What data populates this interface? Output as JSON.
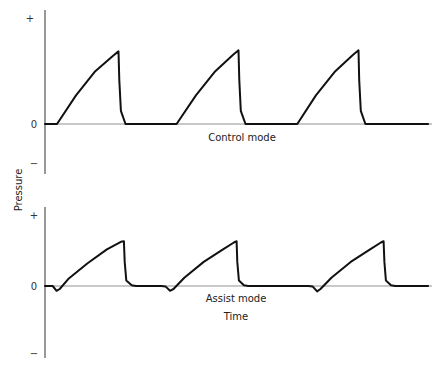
{
  "chart_data": [
    {
      "type": "line",
      "title": "Control mode",
      "xlabel": "",
      "ylabel": "Pressure",
      "ytick_labels": [
        "+",
        "0",
        "−"
      ],
      "grid": false,
      "x_units": "time (relative, 0-100)",
      "y_units": "pressure (relative, -1 to 1)",
      "ylim": [
        -1,
        1
      ],
      "xlim": [
        0,
        100
      ],
      "series": [
        {
          "name": "Control mode pressure",
          "points": [
            [
              0,
              0
            ],
            [
              3.1,
              0
            ],
            [
              8,
              0.26
            ],
            [
              13,
              0.48
            ],
            [
              17.6,
              0.62
            ],
            [
              19,
              0.66
            ],
            [
              19.2,
              0.4
            ],
            [
              19.6,
              0.12
            ],
            [
              20.8,
              0
            ],
            [
              34,
              0
            ],
            [
              39,
              0.26
            ],
            [
              44,
              0.48
            ],
            [
              48.6,
              0.63
            ],
            [
              50,
              0.67
            ],
            [
              50.2,
              0.4
            ],
            [
              50.6,
              0.12
            ],
            [
              51.8,
              0
            ],
            [
              65.2,
              0
            ],
            [
              70,
              0.26
            ],
            [
              75,
              0.48
            ],
            [
              79.6,
              0.63
            ],
            [
              81,
              0.67
            ],
            [
              81.2,
              0.4
            ],
            [
              81.6,
              0.12
            ],
            [
              82.8,
              0
            ],
            [
              99,
              0
            ]
          ]
        }
      ]
    },
    {
      "type": "line",
      "title": "Assist mode",
      "xlabel": "Time",
      "ylabel": "Pressure",
      "ytick_labels": [
        "+",
        "0",
        "−"
      ],
      "grid": false,
      "x_units": "time (relative, 0-100)",
      "y_units": "pressure (relative, -1 to 1)",
      "ylim": [
        -1,
        1
      ],
      "xlim": [
        0,
        100
      ],
      "series": [
        {
          "name": "Assist mode pressure",
          "points": [
            [
              0,
              0
            ],
            [
              2,
              0
            ],
            [
              3,
              -0.08
            ],
            [
              3.8,
              -0.05
            ],
            [
              6,
              0.1
            ],
            [
              11,
              0.33
            ],
            [
              16,
              0.53
            ],
            [
              19.6,
              0.64
            ],
            [
              20.4,
              0.65
            ],
            [
              20.6,
              0.35
            ],
            [
              21,
              0.08
            ],
            [
              22.4,
              0.01
            ],
            [
              23.5,
              0
            ],
            [
              30,
              0
            ],
            [
              31.2,
              -0.01
            ],
            [
              32.3,
              -0.08
            ],
            [
              33.2,
              -0.05
            ],
            [
              36,
              0.12
            ],
            [
              41,
              0.35
            ],
            [
              46,
              0.53
            ],
            [
              48.8,
              0.63
            ],
            [
              49.5,
              0.65
            ],
            [
              49.7,
              0.35
            ],
            [
              50.1,
              0.08
            ],
            [
              51.4,
              0.01
            ],
            [
              52.5,
              0
            ],
            [
              68,
              0
            ],
            [
              69.2,
              -0.01
            ],
            [
              70.3,
              -0.09
            ],
            [
              71.2,
              -0.05
            ],
            [
              74,
              0.12
            ],
            [
              79,
              0.35
            ],
            [
              84,
              0.53
            ],
            [
              86.8,
              0.63
            ],
            [
              87.5,
              0.65
            ],
            [
              87.7,
              0.35
            ],
            [
              88.1,
              0.08
            ],
            [
              89.4,
              0.01
            ],
            [
              90.5,
              0
            ],
            [
              99,
              0
            ]
          ]
        }
      ]
    }
  ],
  "labels": {
    "y_axis": "Pressure",
    "top_caption": "Control mode",
    "bottom_caption": "Assist mode",
    "x_axis": "Time",
    "plus": "+",
    "zero": "0",
    "minus": "−"
  }
}
